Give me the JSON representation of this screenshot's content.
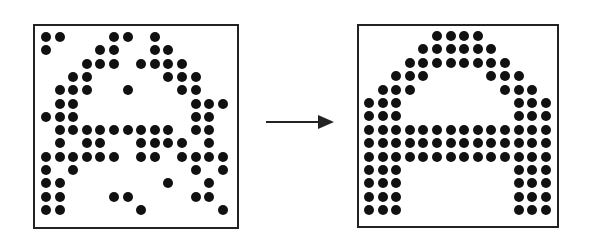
{
  "diagram": {
    "grid_size": {
      "rows": 14,
      "cols": 14
    },
    "colors": {
      "dot": "#111111",
      "border": "#222222",
      "background": "#ffffff"
    },
    "input_pattern": {
      "label": "noisy A",
      "rows": [
        [
          0,
          1,
          5,
          6,
          8
        ],
        [
          0,
          4,
          5,
          8,
          9
        ],
        [
          3,
          4,
          5,
          7,
          8,
          9,
          10
        ],
        [
          2,
          3,
          9,
          10,
          11
        ],
        [
          1,
          2,
          3,
          6,
          10,
          11
        ],
        [
          1,
          2,
          11,
          12,
          13
        ],
        [
          0,
          1,
          2,
          11,
          12
        ],
        [
          1,
          2,
          3,
          4,
          5,
          6,
          7,
          8,
          9,
          11,
          12
        ],
        [
          1,
          3,
          4,
          7,
          8,
          9,
          10,
          12
        ],
        [
          0,
          1,
          2,
          3,
          4,
          5,
          7,
          8,
          10,
          11,
          12,
          13
        ],
        [
          0,
          2,
          11,
          13
        ],
        [
          0,
          1,
          9,
          12
        ],
        [
          0,
          1,
          5,
          6,
          11,
          12
        ],
        [
          0,
          1,
          7,
          13
        ]
      ]
    },
    "arrow": {
      "direction": "right",
      "icon": "arrow-right-icon"
    },
    "output_pattern": {
      "label": "clean A",
      "rows": [
        [
          5,
          6,
          7,
          8
        ],
        [
          4,
          5,
          6,
          7,
          8,
          9
        ],
        [
          3,
          4,
          5,
          6,
          7,
          8,
          9,
          10
        ],
        [
          2,
          3,
          4,
          9,
          10,
          11
        ],
        [
          1,
          2,
          3,
          10,
          11,
          12
        ],
        [
          0,
          1,
          2,
          11,
          12,
          13
        ],
        [
          0,
          1,
          2,
          11,
          12,
          13
        ],
        [
          0,
          1,
          2,
          3,
          4,
          5,
          6,
          7,
          8,
          9,
          10,
          11,
          12,
          13
        ],
        [
          0,
          1,
          2,
          3,
          4,
          5,
          6,
          7,
          8,
          9,
          10,
          11,
          12,
          13
        ],
        [
          0,
          1,
          2,
          3,
          4,
          5,
          6,
          7,
          8,
          9,
          10,
          11,
          12,
          13
        ],
        [
          0,
          1,
          2,
          11,
          12,
          13
        ],
        [
          0,
          1,
          2,
          11,
          12,
          13
        ],
        [
          0,
          1,
          2,
          11,
          12,
          13
        ],
        [
          0,
          1,
          2,
          11,
          12,
          13
        ]
      ]
    }
  }
}
